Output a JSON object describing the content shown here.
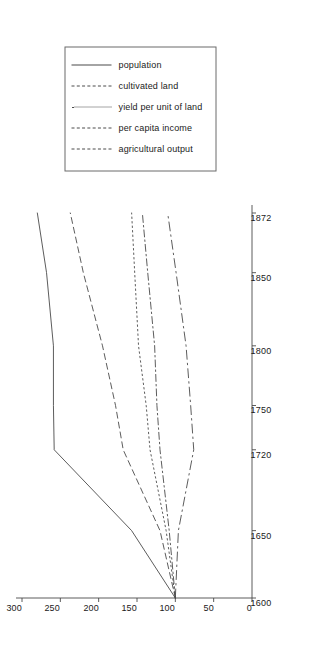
{
  "figure": {
    "rotation_note": "rotated-90-ccw",
    "background": "#ffffff",
    "line_color": "#4a4a4a",
    "axis_color": "#4a4a4a",
    "legend_border": "#6b6b6b"
  },
  "legend": {
    "position": "top-right",
    "entries": [
      {
        "label": "population",
        "style": "solid"
      },
      {
        "label": "cultivated land",
        "style": "dashed"
      },
      {
        "label": "yield per unit of land",
        "style": "dotted"
      },
      {
        "label": "per capita income",
        "style": "dashdot"
      },
      {
        "label": "agricultural output",
        "style": "longdash"
      }
    ]
  },
  "chart_data": {
    "type": "line",
    "title": "",
    "subtitle": "",
    "xlabel": "",
    "ylabel": "",
    "x": [
      1600,
      1650,
      1720,
      1750,
      1800,
      1850,
      1872
    ],
    "xtick_labels": [
      "1600",
      "1650",
      "1720",
      "1750",
      "1800",
      "1850",
      "1872"
    ],
    "ytick_labels": [
      "0",
      "50",
      "100",
      "150",
      "200",
      "250",
      "300"
    ],
    "yticks": [
      0,
      50,
      100,
      150,
      200,
      250,
      300
    ],
    "ylim": [
      0,
      300
    ],
    "grid": false,
    "legend_position": "top-right",
    "index_base": "1600 = 100",
    "series": [
      {
        "name": "population",
        "style": "solid",
        "values": [
          100,
          157,
          258,
          259,
          259,
          268,
          280
        ]
      },
      {
        "name": "cultivated land",
        "style": "dashed",
        "values": [
          100,
          120,
          168,
          178,
          195,
          220,
          237
        ]
      },
      {
        "name": "yield per unit of land",
        "style": "dotted",
        "values": [
          100,
          112,
          133,
          138,
          148,
          153,
          157
        ]
      },
      {
        "name": "per capita income",
        "style": "dashdot",
        "values": [
          100,
          108,
          120,
          124,
          127,
          136,
          143
        ]
      },
      {
        "name": "agricultural output",
        "style": "longdash",
        "values": [
          100,
          96,
          76,
          80,
          86,
          99,
          110
        ]
      }
    ]
  }
}
